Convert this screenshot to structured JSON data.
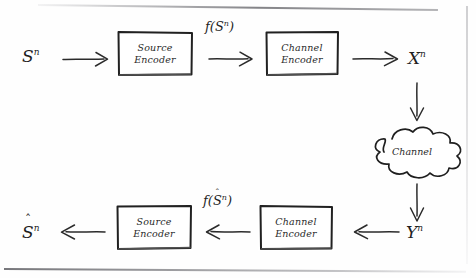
{
  "diagram": {
    "style": "hand-drawn pencil sketch on scanned paper",
    "ink_color": "#1f1f1f",
    "paper_color": "#fefefe",
    "blocks": [
      {
        "id": "source-encoder-top",
        "line1": "Source",
        "line2": "Encoder"
      },
      {
        "id": "channel-encoder-top",
        "line1": "Channel",
        "line2": "Encoder"
      },
      {
        "id": "source-encoder-bottom",
        "line1": "Source",
        "line2": "Encoder"
      },
      {
        "id": "channel-encoder-bottom",
        "line1": "Channel",
        "line2": "Encoder"
      }
    ],
    "cloud": {
      "label": "Channel"
    },
    "signals": {
      "source_in": {
        "base": "S",
        "hat": "",
        "sup": "n"
      },
      "source_encoded": {
        "fn": "f",
        "open": "(",
        "base": "S",
        "hat": "",
        "sup": "n",
        "close": ")"
      },
      "channel_in": {
        "base": "X",
        "hat": "",
        "sup": "n"
      },
      "channel_out": {
        "base": "Y",
        "hat": "",
        "sup": "n"
      },
      "source_decoded_in": {
        "fn": "f",
        "open": "(",
        "base": "S",
        "hat": "ˆ",
        "sup": "n",
        "close": ")"
      },
      "source_out": {
        "base": "S",
        "hat": "ˆ",
        "sup": "n"
      }
    },
    "arrows": [
      {
        "id": "arrow-source-in",
        "direction": "right"
      },
      {
        "id": "arrow-source-to-channel",
        "direction": "right"
      },
      {
        "id": "arrow-channel-out",
        "direction": "right"
      },
      {
        "id": "arrow-x-to-cloud",
        "direction": "down"
      },
      {
        "id": "arrow-cloud-to-y",
        "direction": "down"
      },
      {
        "id": "arrow-y-to-decoder",
        "direction": "left"
      },
      {
        "id": "arrow-channel-to-source",
        "direction": "left"
      },
      {
        "id": "arrow-source-out",
        "direction": "left"
      }
    ]
  }
}
